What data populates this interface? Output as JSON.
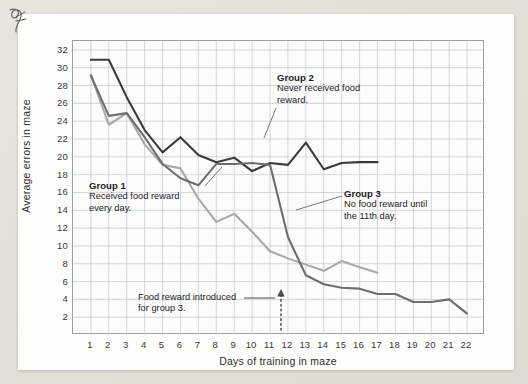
{
  "figure": {
    "ylabel": "Average errors in maze",
    "xlabel": "Days of training in maze"
  },
  "annotations": {
    "group1": {
      "title": "Group 1",
      "line1": "Received food reward",
      "line2": "every day."
    },
    "group2": {
      "title": "Group 2",
      "line1": "Never received food",
      "line2": "reward."
    },
    "group3": {
      "title": "Group 3",
      "line1": "No food reward until",
      "line2": "the 11th day."
    },
    "intro": {
      "line1": "Food reward introduced",
      "line2": "for group 3."
    }
  },
  "colors": {
    "group1": "#a8a8a8",
    "group2": "#3b3b3b",
    "group3": "#6e6e6e",
    "grid": "#c6cdd6",
    "axis": "#8f959b",
    "text": "#1d1d1d",
    "paper": "#fdfdfb",
    "background": "#e3e0d8"
  },
  "chart_data": {
    "type": "line",
    "title": "",
    "xlabel": "Days of training in maze",
    "ylabel": "Average errors in maze",
    "xlim": [
      0,
      23
    ],
    "ylim": [
      0,
      33
    ],
    "xticks": [
      1,
      2,
      3,
      4,
      5,
      6,
      7,
      8,
      9,
      10,
      11,
      12,
      13,
      14,
      15,
      16,
      17,
      18,
      19,
      20,
      21,
      22
    ],
    "yticks": [
      2,
      4,
      6,
      8,
      10,
      12,
      14,
      16,
      18,
      20,
      22,
      24,
      26,
      28,
      30,
      32
    ],
    "grid": true,
    "legend_position": "inline-annotations",
    "x": [
      1,
      2,
      3,
      4,
      5,
      6,
      7,
      8,
      9,
      10,
      11,
      12,
      13,
      14,
      15,
      16,
      17,
      18,
      19,
      20,
      21,
      22
    ],
    "series": [
      {
        "name": "Group 1",
        "description": "Received food reward every day.",
        "color": "#a8a8a8",
        "values": [
          29.2,
          23.6,
          24.9,
          21.4,
          19.1,
          18.7,
          15.3,
          12.7,
          13.6,
          11.6,
          9.4,
          8.6,
          7.9,
          7.2,
          8.3,
          7.6,
          7.0,
          null,
          null,
          null,
          null,
          null
        ]
      },
      {
        "name": "Group 2",
        "description": "Never received food reward.",
        "color": "#3b3b3b",
        "values": [
          30.9,
          30.9,
          26.7,
          23.0,
          20.5,
          22.2,
          20.2,
          19.4,
          19.9,
          18.4,
          19.3,
          19.1,
          21.6,
          18.6,
          19.3,
          19.4,
          19.4,
          null,
          null,
          null,
          null,
          null
        ]
      },
      {
        "name": "Group 3",
        "description": "No food reward until the 11th day.",
        "color": "#6e6e6e",
        "values": [
          29.1,
          24.6,
          24.9,
          22.2,
          19.2,
          17.6,
          16.8,
          19.2,
          19.2,
          19.3,
          19.1,
          11.0,
          6.7,
          5.7,
          5.3,
          5.2,
          4.6,
          4.6,
          3.7,
          3.7,
          4.0,
          2.4
        ]
      }
    ],
    "annotations": [
      {
        "text": "Food reward introduced for group 3.",
        "x": 11,
        "marker": "dotted-arrow-up"
      }
    ]
  }
}
